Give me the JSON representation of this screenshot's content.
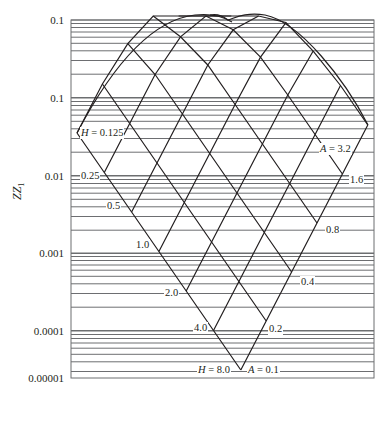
{
  "chart_data": {
    "type": "line",
    "title": "",
    "xlabel": "",
    "ylabel": "ZZ1",
    "y_scale": "log",
    "ylim": [
      1e-05,
      1
    ],
    "y_tick_labels": [
      "0.1",
      "0.1",
      "0.01",
      "0.001",
      "0.0001",
      "0.00001"
    ],
    "grid": "horizontal log gridlines",
    "legend": "none",
    "annotations": {
      "H_family": [
        "H = 0.125",
        "0.25",
        "0.5",
        "1.0",
        "2.0",
        "4.0",
        "H = 8.0"
      ],
      "A_family": [
        "A = 0.1",
        "0.2",
        "0.4",
        "0.8",
        "1.6",
        "A = 3.2"
      ]
    },
    "series": [
      {
        "name": "H = 0.125",
        "param": "H",
        "value": 0.125
      },
      {
        "name": "H = 0.25",
        "param": "H",
        "value": 0.25
      },
      {
        "name": "H = 0.5",
        "param": "H",
        "value": 0.5
      },
      {
        "name": "H = 1.0",
        "param": "H",
        "value": 1.0
      },
      {
        "name": "H = 2.0",
        "param": "H",
        "value": 2.0
      },
      {
        "name": "H = 4.0",
        "param": "H",
        "value": 4.0
      },
      {
        "name": "H = 8.0",
        "param": "H",
        "value": 8.0
      },
      {
        "name": "A = 0.1",
        "param": "A",
        "value": 0.1
      },
      {
        "name": "A = 0.2",
        "param": "A",
        "value": 0.2
      },
      {
        "name": "A = 0.4",
        "param": "A",
        "value": 0.4
      },
      {
        "name": "A = 0.8",
        "param": "A",
        "value": 0.8
      },
      {
        "name": "A = 1.6",
        "param": "A",
        "value": 1.6
      },
      {
        "name": "A = 3.2",
        "param": "A",
        "value": 3.2
      }
    ]
  },
  "axis": {
    "ylabel_main": "ZZ",
    "ylabel_sub": "1",
    "ticks": [
      {
        "label": "0.1",
        "y": 20
      },
      {
        "label": "0.1",
        "y": 98
      },
      {
        "label": "0.01",
        "y": 176
      },
      {
        "label": "0.001",
        "y": 253
      },
      {
        "label": "0.0001",
        "y": 331
      },
      {
        "label": "0.00001",
        "y": 378
      }
    ]
  },
  "labels": {
    "h0": "H = 0.125",
    "h1": "0.25",
    "h2": "0.5",
    "h3": "1.0",
    "h4": "2.0",
    "h5": "4.0",
    "h6": "H = 8.0",
    "a0": "A = 0.1",
    "a1": "0.2",
    "a2": "0.4",
    "a3": "0.8",
    "a4": "1.6",
    "a5": "A = 3.2"
  },
  "colors": {
    "line": "#231f20",
    "grid": "#6d6e71"
  }
}
